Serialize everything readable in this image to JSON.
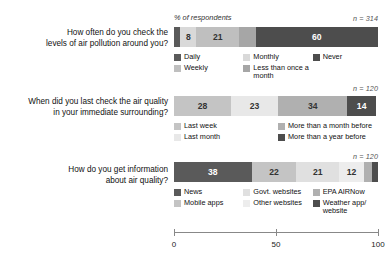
{
  "axis_title": "% of respondents",
  "chart_data": {
    "type": "bar",
    "subtype": "stacked-horizontal-100",
    "title": "",
    "xlabel": "% of respondents",
    "ylabel": "",
    "xlim": [
      0,
      100
    ],
    "ticks": [
      0,
      50,
      100
    ],
    "tick_labels": [
      "0",
      "50",
      "100"
    ],
    "grid": false,
    "legend_position": "below-each-bar",
    "groups": [
      {
        "question": [
          "How often do you check the",
          "levels of air pollution around you?"
        ],
        "n_label": "n = 314",
        "n": 314,
        "categories": [
          "Daily",
          "Weekly",
          "Monthly",
          "Less than once a month",
          "Never"
        ],
        "values": [
          3,
          8,
          21,
          8,
          60
        ],
        "data_labels": [
          "",
          "8",
          "21",
          "",
          "60"
        ],
        "colors": [
          "#5a5a5a",
          "#d9d9d9",
          "#bfbfbf",
          "#a6a6a6",
          "#4d4d4d"
        ],
        "label_colors": [
          "#ffffff",
          "#333333",
          "#333333",
          "#333333",
          "#ffffff"
        ],
        "legend": [
          {
            "label": "Daily",
            "color": "#5a5a5a"
          },
          {
            "label": "Monthly",
            "color": "#d9d9d9"
          },
          {
            "label": "Never",
            "color": "#4d4d4d"
          },
          {
            "label": "Weekly",
            "color": "#bfbfbf"
          },
          {
            "label": "Less than once a month",
            "color": "#a6a6a6"
          }
        ]
      },
      {
        "question": [
          "When did you last check the air quality",
          "in your immediate surrounding?"
        ],
        "n_label": "n = 120",
        "n": 120,
        "categories": [
          "Last week",
          "Last month",
          "More than a month before",
          "More than a year before"
        ],
        "values": [
          28,
          23,
          34,
          14
        ],
        "data_labels": [
          "28",
          "23",
          "34",
          "14"
        ],
        "colors": [
          "#c4c4c4",
          "#e8e8e8",
          "#b0b0b0",
          "#4d4d4d"
        ],
        "label_colors": [
          "#333333",
          "#333333",
          "#333333",
          "#ffffff"
        ],
        "legend": [
          {
            "label": "Last week",
            "color": "#c4c4c4"
          },
          {
            "label": "More than a month before",
            "color": "#b0b0b0"
          },
          {
            "label": "Last month",
            "color": "#e8e8e8"
          },
          {
            "label": "More than a year before",
            "color": "#4d4d4d"
          }
        ]
      },
      {
        "question": [
          "How do you get information",
          "about air quality?"
        ],
        "n_label": "n = 120",
        "n": 120,
        "categories": [
          "News",
          "Mobile apps",
          "Govt. websites",
          "Other websites",
          "EPA AIRNow",
          "Weather app/website"
        ],
        "values": [
          38,
          22,
          21,
          12,
          4,
          3
        ],
        "data_labels": [
          "38",
          "22",
          "21",
          "12",
          "",
          ""
        ],
        "colors": [
          "#5a5a5a",
          "#c4c4c4",
          "#e0e0e0",
          "#ededed",
          "#b0b0b0",
          "#4d4d4d"
        ],
        "label_colors": [
          "#ffffff",
          "#333333",
          "#333333",
          "#333333",
          "#333333",
          "#ffffff"
        ],
        "legend": [
          {
            "label": "News",
            "color": "#5a5a5a"
          },
          {
            "label": "Govt. websites",
            "color": "#e0e0e0"
          },
          {
            "label": "EPA AIRNow",
            "color": "#b0b0b0"
          },
          {
            "label": "Mobile apps",
            "color": "#c4c4c4"
          },
          {
            "label": "Other websites",
            "color": "#ededed"
          },
          {
            "label": "Weather app/\nwebsite",
            "color": "#4d4d4d"
          }
        ]
      }
    ]
  }
}
